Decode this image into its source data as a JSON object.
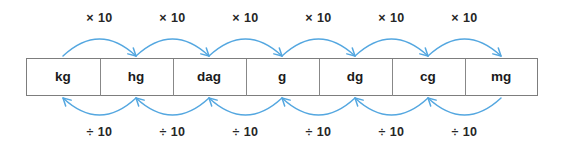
{
  "diagram": {
    "background_color": "#ffffff",
    "arrow_color": "#54A7E0",
    "border_color": "#7d7d7d",
    "text_color": "#1b1b1b",
    "units": [
      {
        "label": "kg"
      },
      {
        "label": "hg"
      },
      {
        "label": "dag"
      },
      {
        "label": "g"
      },
      {
        "label": "dg"
      },
      {
        "label": "cg"
      },
      {
        "label": "mg"
      }
    ],
    "top_operations": [
      {
        "label": "× 10"
      },
      {
        "label": "× 10"
      },
      {
        "label": "× 10"
      },
      {
        "label": "× 10"
      },
      {
        "label": "× 10"
      },
      {
        "label": "× 10"
      }
    ],
    "bottom_operations": [
      {
        "label": "÷ 10"
      },
      {
        "label": "÷ 10"
      },
      {
        "label": "÷ 10"
      },
      {
        "label": "÷ 10"
      },
      {
        "label": "÷ 10"
      },
      {
        "label": "÷ 10"
      }
    ]
  },
  "chart_data": {
    "type": "diagram",
    "categories": [
      "kg",
      "hg",
      "dag",
      "g",
      "dg",
      "cg",
      "mg"
    ],
    "forward_direction": "left-to-right",
    "forward_operation": "× 10",
    "reverse_direction": "right-to-left",
    "reverse_operation": "÷ 10",
    "top_annotations": [
      "× 10",
      "× 10",
      "× 10",
      "× 10",
      "× 10",
      "× 10"
    ],
    "bottom_annotations": [
      "÷ 10",
      "÷ 10",
      "÷ 10",
      "÷ 10",
      "÷ 10",
      "÷ 10"
    ],
    "legend": [],
    "grid": false
  }
}
